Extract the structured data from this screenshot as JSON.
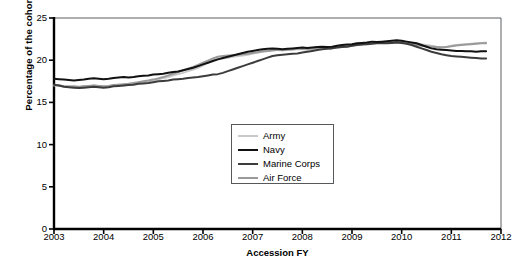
{
  "chart_data": {
    "type": "line",
    "title": "",
    "xlabel": "Accession FY",
    "ylabel": "Percentage of the cohort",
    "xlim": [
      2003,
      2012
    ],
    "ylim": [
      0,
      25
    ],
    "yticks": [
      0,
      5,
      10,
      15,
      20,
      25
    ],
    "xticks": [
      2003,
      2004,
      2005,
      2006,
      2007,
      2008,
      2009,
      2010,
      2011,
      2012
    ],
    "grid": false,
    "legend_position": "center",
    "x": [
      2003.0,
      2003.1,
      2003.2,
      2003.3,
      2003.4,
      2003.5,
      2003.6,
      2003.7,
      2003.8,
      2003.9,
      2004.0,
      2004.1,
      2004.2,
      2004.3,
      2004.4,
      2004.5,
      2004.6,
      2004.7,
      2004.8,
      2004.9,
      2005.0,
      2005.1,
      2005.2,
      2005.3,
      2005.4,
      2005.5,
      2005.6,
      2005.7,
      2005.8,
      2005.9,
      2006.0,
      2006.1,
      2006.2,
      2006.3,
      2006.4,
      2006.5,
      2006.6,
      2006.7,
      2006.8,
      2006.9,
      2007.0,
      2007.1,
      2007.2,
      2007.3,
      2007.4,
      2007.5,
      2007.6,
      2007.7,
      2007.8,
      2007.9,
      2008.0,
      2008.1,
      2008.2,
      2008.3,
      2008.4,
      2008.5,
      2008.6,
      2008.7,
      2008.8,
      2008.9,
      2009.0,
      2009.1,
      2009.2,
      2009.3,
      2009.4,
      2009.5,
      2009.6,
      2009.7,
      2009.8,
      2009.9,
      2010.0,
      2010.1,
      2010.2,
      2010.3,
      2010.4,
      2010.5,
      2010.6,
      2010.7,
      2010.8,
      2010.9,
      2011.0,
      2011.1,
      2011.2,
      2011.3,
      2011.4,
      2011.5,
      2011.6,
      2011.7
    ],
    "series": [
      {
        "name": "Army",
        "color": "#c8c8c8",
        "width": 2.0,
        "values": [
          17.0,
          17.05,
          16.9,
          16.95,
          16.85,
          16.8,
          16.9,
          16.95,
          17.0,
          16.95,
          16.85,
          16.9,
          17.0,
          17.1,
          17.0,
          17.1,
          17.2,
          17.25,
          17.4,
          17.5,
          17.6,
          17.75,
          17.9,
          18.0,
          18.2,
          18.35,
          18.5,
          18.7,
          18.9,
          19.1,
          19.4,
          19.7,
          20.0,
          20.15,
          20.2,
          20.3,
          20.4,
          20.5,
          20.55,
          20.65,
          20.8,
          20.9,
          21.0,
          21.1,
          21.2,
          21.2,
          21.15,
          21.2,
          21.25,
          21.3,
          21.3,
          21.25,
          21.3,
          21.35,
          21.4,
          21.4,
          21.45,
          21.5,
          21.55,
          21.6,
          21.7,
          21.8,
          21.9,
          22.0,
          22.05,
          22.1,
          22.15,
          22.1,
          22.15,
          22.2,
          22.15,
          22.1,
          22.0,
          21.9,
          21.85,
          21.8,
          21.7,
          21.6,
          21.55,
          21.6,
          21.7,
          21.8,
          21.85,
          21.9,
          21.95,
          22.0,
          22.05,
          22.1
        ]
      },
      {
        "name": "Navy",
        "color": "#111111",
        "width": 2.0,
        "values": [
          17.8,
          17.75,
          17.7,
          17.65,
          17.6,
          17.65,
          17.7,
          17.8,
          17.85,
          17.8,
          17.75,
          17.8,
          17.9,
          17.95,
          18.0,
          17.95,
          18.0,
          18.1,
          18.15,
          18.2,
          18.3,
          18.35,
          18.4,
          18.5,
          18.6,
          18.65,
          18.8,
          18.95,
          19.1,
          19.3,
          19.5,
          19.7,
          19.9,
          20.1,
          20.25,
          20.4,
          20.55,
          20.7,
          20.85,
          21.0,
          21.1,
          21.2,
          21.3,
          21.35,
          21.4,
          21.35,
          21.3,
          21.35,
          21.4,
          21.45,
          21.5,
          21.45,
          21.5,
          21.55,
          21.6,
          21.55,
          21.6,
          21.7,
          21.8,
          21.85,
          21.9,
          22.0,
          22.05,
          22.1,
          22.2,
          22.15,
          22.2,
          22.25,
          22.3,
          22.35,
          22.3,
          22.2,
          22.1,
          22.0,
          21.8,
          21.6,
          21.4,
          21.3,
          21.25,
          21.2,
          21.15,
          21.1,
          21.1,
          21.05,
          21.05,
          21.0,
          21.05,
          21.05
        ]
      },
      {
        "name": "Marine Corps",
        "color": "#3c3c3c",
        "width": 2.0,
        "values": [
          17.1,
          17.0,
          16.85,
          16.8,
          16.75,
          16.7,
          16.75,
          16.8,
          16.85,
          16.8,
          16.75,
          16.8,
          16.9,
          16.95,
          17.0,
          17.05,
          17.1,
          17.2,
          17.25,
          17.3,
          17.4,
          17.5,
          17.55,
          17.6,
          17.7,
          17.75,
          17.8,
          17.9,
          17.95,
          18.0,
          18.1,
          18.2,
          18.3,
          18.35,
          18.5,
          18.7,
          18.9,
          19.1,
          19.3,
          19.5,
          19.7,
          19.9,
          20.1,
          20.3,
          20.5,
          20.6,
          20.65,
          20.7,
          20.75,
          20.8,
          20.9,
          21.0,
          21.1,
          21.2,
          21.3,
          21.35,
          21.4,
          21.5,
          21.55,
          21.6,
          21.7,
          21.8,
          21.85,
          21.9,
          21.95,
          22.0,
          22.05,
          22.0,
          22.05,
          22.1,
          22.05,
          21.95,
          21.8,
          21.6,
          21.4,
          21.2,
          21.0,
          20.85,
          20.7,
          20.6,
          20.5,
          20.45,
          20.4,
          20.35,
          20.3,
          20.25,
          20.2,
          20.2
        ]
      },
      {
        "name": "Air Force",
        "color": "#9a9a9a",
        "width": 2.0,
        "values": [
          17.05,
          17.0,
          16.9,
          16.85,
          16.9,
          16.85,
          16.9,
          16.95,
          17.0,
          16.95,
          16.9,
          16.95,
          17.05,
          17.1,
          17.15,
          17.2,
          17.3,
          17.4,
          17.5,
          17.6,
          17.7,
          17.85,
          18.0,
          18.2,
          18.4,
          18.6,
          18.8,
          19.0,
          19.2,
          19.45,
          19.7,
          19.95,
          20.2,
          20.4,
          20.5,
          20.55,
          20.6,
          20.65,
          20.7,
          20.75,
          20.85,
          20.95,
          21.05,
          21.1,
          21.15,
          21.2,
          21.2,
          21.25,
          21.3,
          21.35,
          21.4,
          21.35,
          21.4,
          21.45,
          21.5,
          21.5,
          21.55,
          21.6,
          21.65,
          21.7,
          21.75,
          21.85,
          21.9,
          21.95,
          22.0,
          22.05,
          22.1,
          22.05,
          22.1,
          22.15,
          22.1,
          22.0,
          21.9,
          21.8,
          21.7,
          21.65,
          21.6,
          21.55,
          21.5,
          21.55,
          21.65,
          21.75,
          21.8,
          21.85,
          21.9,
          21.95,
          22.0,
          22.0
        ]
      }
    ]
  },
  "axes": {
    "ylabel": "Percentage of the cohort",
    "xlabel": "Accession FY",
    "ytick_labels": [
      "0",
      "5",
      "10",
      "15",
      "20",
      "25"
    ],
    "xtick_labels": [
      "2003",
      "2004",
      "2005",
      "2006",
      "2007",
      "2008",
      "2009",
      "2010",
      "2011",
      "2012"
    ]
  },
  "legend": {
    "entries": [
      {
        "label": "Army",
        "color": "#c8c8c8"
      },
      {
        "label": "Navy",
        "color": "#111111"
      },
      {
        "label": "Marine Corps",
        "color": "#3c3c3c"
      },
      {
        "label": "Air Force",
        "color": "#9a9a9a"
      }
    ]
  }
}
